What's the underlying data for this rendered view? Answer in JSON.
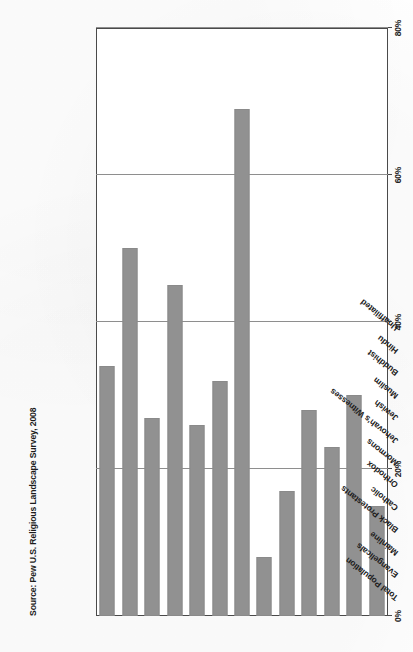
{
  "source_note": "Source: Pew U.S. Religious Landscape Survey, 2008",
  "axis": {
    "tick_labels": [
      "0%",
      "20%",
      "40%",
      "60%",
      "80%"
    ],
    "tick_values": [
      0,
      20,
      40,
      60,
      80
    ]
  },
  "colors": {
    "bar": "#919191",
    "grid": "#8e8e8e",
    "frame": "#4a4a4a",
    "text": "#1c1c1c",
    "page": "#fefefe"
  },
  "chart_data": {
    "type": "bar",
    "orientation": "horizontal",
    "title": "",
    "subtitle": "",
    "xlabel": "",
    "ylabel": "",
    "xlim": [
      0,
      80
    ],
    "grid": true,
    "legend": "none",
    "categories": [
      "Total Population",
      "Evangelicals",
      "Mainline",
      "Black Protestants",
      "Catholic",
      "Orthodox",
      "Mormons",
      "Jehovah's Witnesses",
      "Jewish",
      "Muslim",
      "Buddhist",
      "Hindu",
      "Unaffiliated"
    ],
    "values": [
      34,
      50,
      27,
      45,
      26,
      32,
      69,
      8,
      17,
      28,
      23,
      30,
      15
    ]
  }
}
